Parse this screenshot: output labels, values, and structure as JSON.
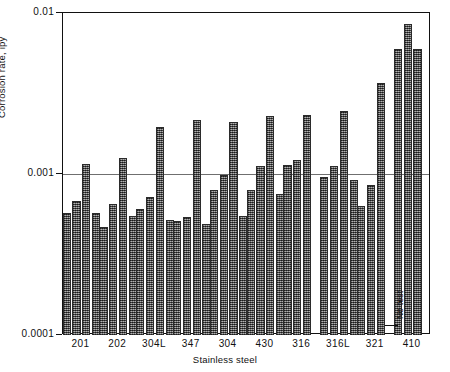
{
  "chart_data": {
    "type": "bar",
    "title": "",
    "subtitle": "",
    "xlabel": "Stainless steel",
    "ylabel": "Corrosion rate, ipy",
    "yscale": "log",
    "ylim": [
      0.0001,
      0.01
    ],
    "ytick_labels": [
      "0.01",
      "0.001",
      "0.0001"
    ],
    "ytick_values": [
      0.01,
      0.001,
      0.0001
    ],
    "grid": "horizontal-at-0.001",
    "legend": "none",
    "legend_position": "none",
    "categories": [
      "201",
      "202",
      "304L",
      "347",
      "304",
      "430",
      "316",
      "316L",
      "321",
      "410"
    ],
    "series": [
      {
        "name": "bar 1",
        "values": [
          0.00057,
          0.00047,
          0.00061,
          0.00051,
          0.00079,
          0.00079,
          0.00113,
          0.00096,
          0.00063,
          0.006
        ]
      },
      {
        "name": "bar 2",
        "values": [
          0.00068,
          0.00065,
          0.00072,
          0.00054,
          0.00098,
          0.00112,
          0.00122,
          0.00112,
          0.00086,
          0.0085
        ]
      },
      {
        "name": "bar 3",
        "values": [
          0.00115,
          0.00125,
          0.00195,
          0.00215,
          0.0021,
          0.0023,
          0.00232,
          0.00245,
          0.0037,
          0.006
        ]
      },
      {
        "name": "bar 4",
        "values": [
          0.00057,
          0.00055,
          0.00052,
          0.00049,
          0.00055,
          0.00075,
          null,
          0.00092,
          null,
          null
        ]
      }
    ],
    "annotations": [
      {
        "text": "No test",
        "category": "321",
        "note": "missing third bar in 321 group"
      }
    ]
  },
  "axes": {
    "y": {
      "ticks": [
        {
          "label": "0.01",
          "value": 0.01
        },
        {
          "label": "0.001",
          "value": 0.001
        },
        {
          "label": "0.0001",
          "value": 0.0001
        }
      ]
    },
    "x": {
      "ticks": [
        {
          "label": "201"
        },
        {
          "label": "202"
        },
        {
          "label": "304L"
        },
        {
          "label": "347"
        },
        {
          "label": "304"
        },
        {
          "label": "430"
        },
        {
          "label": "316"
        },
        {
          "label": "316L"
        },
        {
          "label": "321"
        },
        {
          "label": "410"
        }
      ]
    }
  },
  "colors": {
    "bar_fill": "#707070",
    "bar_edge": "#2b2b2b",
    "axis": "#111111",
    "grid": "#6f6f6f",
    "background": "#ffffff"
  }
}
